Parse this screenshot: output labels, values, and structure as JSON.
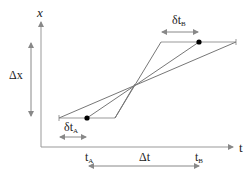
{
  "diagram": {
    "axes": {
      "vertical_label": "x",
      "horizontal_label": "t"
    },
    "labels": {
      "delta_x": "Δx",
      "delta_t": "Δt",
      "t_a": "t",
      "t_a_sub": "A",
      "t_b": "t",
      "t_b_sub": "B",
      "delta_t_a": "δt",
      "delta_t_a_sub": "A",
      "delta_t_b": "δt",
      "delta_t_b_sub": "B"
    },
    "colors": {
      "line": "#888888",
      "point": "#000000",
      "text": "#222222"
    }
  }
}
